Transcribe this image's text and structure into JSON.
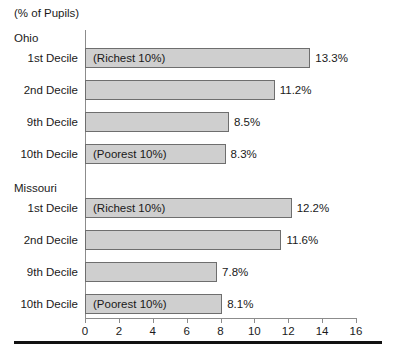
{
  "chart_data": {
    "type": "bar",
    "orientation": "horizontal",
    "title": "(% of Pupils)",
    "xlabel": "",
    "ylabel": "",
    "xlim": [
      0,
      16
    ],
    "xticks": [
      0,
      2,
      4,
      6,
      8,
      10,
      12,
      14,
      16
    ],
    "xtick_labels": [
      "0",
      "2",
      "4",
      "6",
      "8",
      "10",
      "12",
      "14",
      "16"
    ],
    "grid": false,
    "legend": false,
    "bar_color": "#cfcfcf",
    "bar_edge_color": "#6e6e6e",
    "axis_color": "#8c8c8c",
    "groups": [
      {
        "name": "Ohio",
        "categories": [
          "1st Decile",
          "2nd Decile",
          "9th Decile",
          "10th Decile"
        ],
        "values": [
          13.3,
          11.2,
          8.5,
          8.3
        ],
        "value_labels": [
          "13.3%",
          "11.2%",
          "8.5%",
          "8.3%"
        ],
        "annotations": [
          "(Richest 10%)",
          "",
          "",
          "(Poorest 10%)"
        ]
      },
      {
        "name": "Missouri",
        "categories": [
          "1st Decile",
          "2nd Decile",
          "9th Decile",
          "10th Decile"
        ],
        "values": [
          12.2,
          11.6,
          7.8,
          8.1
        ],
        "value_labels": [
          "12.2%",
          "11.6%",
          "7.8%",
          "8.1%"
        ],
        "annotations": [
          "(Richest 10%)",
          "",
          "",
          "(Poorest 10%)"
        ]
      }
    ]
  }
}
